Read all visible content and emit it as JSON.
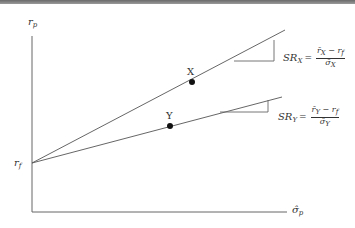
{
  "diagram": {
    "axes": {
      "y_label": "r",
      "y_label_sub": "p",
      "x_label": "σ̂",
      "x_label_sub": "p",
      "intercept_label": "r",
      "intercept_label_sub": "f"
    },
    "points": [
      {
        "label": "X"
      },
      {
        "label": "Y"
      }
    ],
    "formulas": {
      "x": {
        "lhs": "SR",
        "lhs_sub": "X",
        "eq": "=",
        "num": "r̄",
        "num_sub": "X",
        "minus": " − r",
        "minus_sub": "f",
        "den": "σ̂",
        "den_sub": "X"
      },
      "y": {
        "lhs": "SR",
        "lhs_sub": "Y",
        "eq": "=",
        "num": "r̄",
        "num_sub": "Y",
        "minus": " − r",
        "minus_sub": "f",
        "den": "σ̂",
        "den_sub": "Y"
      }
    },
    "colors": {
      "line": "#555555",
      "text": "#333333",
      "dot": "#111111"
    }
  }
}
